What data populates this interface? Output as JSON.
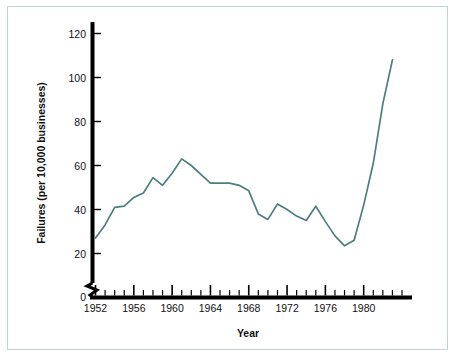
{
  "figure": {
    "frame_color": "#c3d4d6",
    "background": "#ffffff"
  },
  "chart_data": {
    "type": "line",
    "title": "",
    "subtitle": "",
    "xlabel": "Year",
    "ylabel": "Failures (per 10,000 businesses)",
    "xlim": [
      1952,
      1984
    ],
    "ylim": [
      0,
      126
    ],
    "y_axis_break": true,
    "y_break_between": [
      0,
      20
    ],
    "grid": false,
    "legend": null,
    "series_color": "#4c7f7c",
    "axis_color": "#000000",
    "y_ticks": [
      0,
      20,
      40,
      60,
      80,
      100,
      120
    ],
    "y_tick_labels": [
      "0",
      "20",
      "40",
      "60",
      "80",
      "100",
      "120"
    ],
    "x_ticks": [
      1952,
      1953,
      1954,
      1955,
      1956,
      1957,
      1958,
      1959,
      1960,
      1961,
      1962,
      1963,
      1964,
      1965,
      1966,
      1967,
      1968,
      1969,
      1970,
      1971,
      1972,
      1973,
      1974,
      1975,
      1976,
      1977,
      1978,
      1979,
      1980,
      1981,
      1982,
      1983,
      1984
    ],
    "x_tick_labels_major": [
      "1952",
      "1956",
      "1960",
      "1964",
      "1968",
      "1972",
      "1976",
      "1980"
    ],
    "x_major_ticks": [
      1952,
      1956,
      1960,
      1964,
      1968,
      1972,
      1976,
      1980
    ],
    "x": [
      1952,
      1953,
      1954,
      1955,
      1956,
      1957,
      1958,
      1959,
      1960,
      1961,
      1962,
      1963,
      1964,
      1965,
      1966,
      1967,
      1968,
      1969,
      1970,
      1971,
      1972,
      1973,
      1974,
      1975,
      1976,
      1977,
      1978,
      1979,
      1980,
      1981,
      1982,
      1983
    ],
    "values": [
      27,
      33,
      41,
      41.5,
      45.5,
      47.5,
      54.5,
      51,
      56.5,
      63,
      60,
      56,
      52,
      52,
      52,
      51,
      48.5,
      38,
      35.5,
      42.5,
      40,
      37,
      35,
      41.5,
      34.5,
      28,
      23.5,
      26,
      42,
      61,
      88,
      108
    ],
    "series": [
      {
        "name": "Business failure rate",
        "values": [
          27,
          33,
          41,
          41.5,
          45.5,
          47.5,
          54.5,
          51,
          56.5,
          63,
          60,
          56,
          52,
          52,
          52,
          51,
          48.5,
          38,
          35.5,
          42.5,
          40,
          37,
          35,
          41.5,
          34.5,
          28,
          23.5,
          26,
          42,
          61,
          88,
          108
        ]
      }
    ],
    "annotations": []
  }
}
